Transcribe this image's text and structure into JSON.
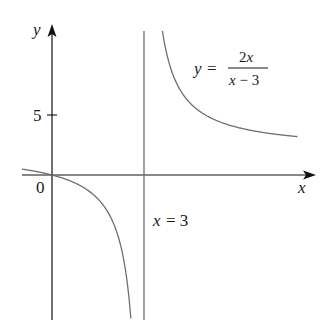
{
  "chart_data": {
    "type": "line",
    "title": "",
    "function": "y = 2x/(x-3)",
    "xlabel": "x",
    "ylabel": "y",
    "origin_label": "0",
    "y_ticks": [
      {
        "value": 5,
        "label": "5"
      }
    ],
    "x_ticks": [],
    "vertical_asymptote": {
      "x": 3,
      "label": "x = 3"
    },
    "horizontal_asymptote": {
      "y": 2
    },
    "curve_label": {
      "lhs": "y =",
      "numerator": "2x",
      "denominator": "x − 3"
    },
    "xlim": [
      -1.0,
      8.5
    ],
    "ylim": [
      -12,
      12.5
    ],
    "grid": false,
    "series": [
      {
        "name": "left branch",
        "x": [
          -1.0,
          -0.5,
          0,
          0.5,
          1.0,
          1.5,
          2.0,
          2.3,
          2.5,
          2.57
        ],
        "y": [
          0.5,
          0.29,
          0,
          -0.4,
          -1.0,
          -2.0,
          -4.0,
          -6.57,
          -10.0,
          -11.95
        ]
      },
      {
        "name": "right branch",
        "x": [
          3.6,
          3.8,
          4.0,
          4.5,
          5.0,
          6.0,
          7.0,
          8.0
        ],
        "y": [
          12.0,
          9.5,
          8.0,
          6.0,
          5.0,
          4.0,
          3.5,
          3.2
        ]
      }
    ]
  },
  "labels": {
    "y_axis": "y",
    "x_axis": "x",
    "origin": "0",
    "tick_5": "5",
    "asymptote": "x = 3",
    "eq_lhs": "y =",
    "eq_num": "2x",
    "eq_den": "x − 3"
  },
  "colors": {
    "axis": "#111111",
    "curve": "#6e6e6e",
    "asymptote": "#6e6e6e"
  }
}
